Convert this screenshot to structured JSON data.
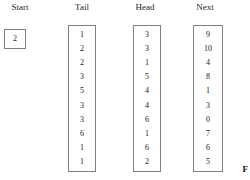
{
  "figure": {
    "headers": {
      "start": "Start",
      "tail": "Tail",
      "head": "Head",
      "next": "Next"
    },
    "start_box": {
      "value": "2"
    },
    "columns": {
      "tail": [
        "1",
        "2",
        "2",
        "3",
        "5",
        "3",
        "3",
        "6",
        "1",
        "1"
      ],
      "head": [
        "3",
        "3",
        "1",
        "5",
        "4",
        "4",
        "6",
        "1",
        "6",
        "2"
      ],
      "next": [
        "9",
        "10",
        "4",
        "8",
        "1",
        "3",
        "0",
        "7",
        "6",
        "5"
      ]
    },
    "caption_fragment": "F",
    "colors": {
      "border": "#808080",
      "text": "#1a1a1a",
      "background": "#ffffff"
    }
  }
}
